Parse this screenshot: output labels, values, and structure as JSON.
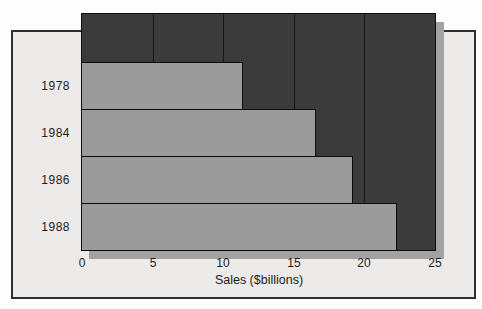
{
  "figure": {
    "background_color": "#fdfdfd",
    "panel_color": "#ecebea",
    "panel_border_color": "#2e2e2e",
    "plot_background_color": "#3b3b3b",
    "plot_border_color": "#0d0d0d",
    "bar_color": "#9b9b9b",
    "bar_border_color": "#0d0d0d",
    "gridline_color": "#161616",
    "shadow_color": "#a2a2a2",
    "text_color": "#1c1c1c"
  },
  "chart_data": {
    "type": "bar",
    "orientation": "horizontal",
    "title": "",
    "xlabel": "Sales ($billions)",
    "ylabel": "",
    "categories": [
      "1978",
      "1984",
      "1986",
      "1988"
    ],
    "values": [
      11.4,
      16.6,
      19.2,
      22.3
    ],
    "xlim": [
      0,
      25
    ],
    "xticks": [
      "0",
      "5",
      "10",
      "15",
      "20",
      "25"
    ],
    "grid": "vertical-gridlines-at-ticks",
    "legend": "none"
  }
}
